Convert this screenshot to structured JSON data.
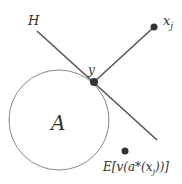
{
  "diagram": {
    "labels": {
      "hyperplane": "H",
      "point_y": "y",
      "point_x": "x",
      "point_x_sub": "j",
      "set": "A",
      "expectation": "E[v(a*(x",
      "expectation_sub": "j",
      "expectation_end": "))]"
    },
    "colors": {
      "stroke": "#555555",
      "circle": "#777777",
      "dot": "#333333",
      "text": "#333333"
    }
  }
}
